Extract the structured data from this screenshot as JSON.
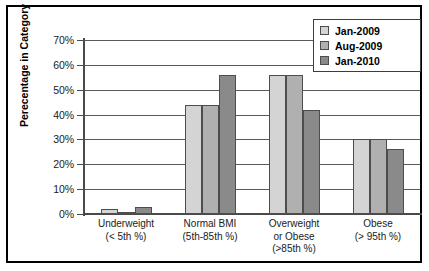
{
  "chart_data": {
    "type": "bar",
    "title": "",
    "xlabel": "",
    "ylabel": "Perecentage in Category",
    "ylim": [
      0,
      70
    ],
    "ytick_labels": [
      "0%",
      "10%",
      "20%",
      "30%",
      "40%",
      "50%",
      "60%",
      "70%"
    ],
    "ytick_values": [
      0,
      10,
      20,
      30,
      40,
      50,
      60,
      70
    ],
    "grid": "horizontal",
    "legend_position": "top-right",
    "categories": [
      "Underweight\n(< 5th %)",
      "Normal BMI\n(5th-85th %)",
      "Overweight\nor Obese\n(>85th %)",
      "Obese\n(> 95th %)"
    ],
    "category_lines": [
      [
        "Underweight",
        "(< 5th %)"
      ],
      [
        "Normal BMI",
        "(5th-85th %)"
      ],
      [
        "Overweight",
        "or Obese",
        "(>85th %)"
      ],
      [
        "Obese",
        "(> 95th %)"
      ]
    ],
    "series": [
      {
        "name": "Jan-2009",
        "color": "#d4d4d4",
        "values": [
          2,
          44,
          56,
          30
        ]
      },
      {
        "name": "Aug-2009",
        "color": "#b0b0b0",
        "values": [
          1,
          44,
          56,
          30
        ]
      },
      {
        "name": "Jan-2010",
        "color": "#8a8a8a",
        "values": [
          3,
          56,
          42,
          26
        ]
      }
    ]
  },
  "legend": {
    "items": [
      {
        "label": "Jan-2009"
      },
      {
        "label": "Aug-2009"
      },
      {
        "label": "Jan-2010"
      }
    ]
  }
}
